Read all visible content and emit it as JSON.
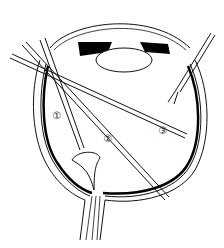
{
  "diagram": {
    "labels": [
      {
        "id": "1",
        "text": "①",
        "x": 57,
        "y": 115
      },
      {
        "id": "2",
        "text": "②",
        "x": 108,
        "y": 138
      },
      {
        "id": "3",
        "text": "③",
        "x": 163,
        "y": 130
      }
    ],
    "colors": {
      "line": "#111111",
      "background": "#ffffff"
    }
  }
}
